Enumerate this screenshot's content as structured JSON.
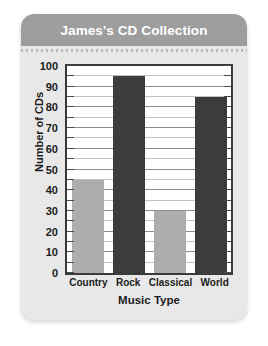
{
  "card": {
    "background_color": "#e8e8e8",
    "title_bar_color": "#9e9e9e"
  },
  "chart_data": {
    "type": "bar",
    "title": "James's CD Collection",
    "xlabel": "Music Type",
    "ylabel": "Number of CDs",
    "categories": [
      "Country",
      "Rock",
      "Classical",
      "World"
    ],
    "values": [
      45,
      95,
      30,
      85
    ],
    "bar_colors": [
      "#adadad",
      "#3c3c3c",
      "#adadad",
      "#3c3c3c"
    ],
    "ylim": [
      0,
      100
    ],
    "y_ticks": [
      0,
      10,
      20,
      30,
      40,
      50,
      60,
      70,
      80,
      90,
      100
    ],
    "y_minor_step": 5,
    "grid": true,
    "legend": "none"
  }
}
